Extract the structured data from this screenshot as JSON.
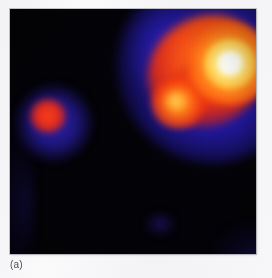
{
  "figure": {
    "panel_label": "(a)",
    "caption_color": "#4b4b52",
    "page_background": "#f5f5f7",
    "frame": {
      "background": "#030206",
      "left": 10,
      "top": 9,
      "width": 246,
      "height": 245
    }
  },
  "palette": {
    "name": "hot-iron",
    "background": "#030206",
    "low": "#1f16a8",
    "mid_low": "#7a1a50",
    "mid": "#ee3a0e",
    "mid_high": "#ffa826",
    "high": "#ffe680",
    "peak": "#ffffff"
  },
  "image_content": {
    "type": "false-color-intensity-map",
    "sources": [
      {
        "name": "primary-source",
        "description": "bright extended source, upper right, with saturated white core",
        "center_x": 220,
        "center_y": 54,
        "peak_color": "#ffffff",
        "halo_color": "#2a1ebe"
      },
      {
        "name": "secondary-knot",
        "description": "orange-yellow knot on the south-west extension of the primary source",
        "center_x": 168,
        "center_y": 94,
        "peak_color": "#ffd668",
        "halo_color": "#f13a0e"
      },
      {
        "name": "companion-source",
        "description": "small compact source, left of field, red core with blue halo",
        "center_x": 38,
        "center_y": 107,
        "peak_color": "#f2300f",
        "halo_color": "#2e22be"
      },
      {
        "name": "faint-feature-lower",
        "description": "very faint blue detection near lower centre",
        "center_x": 150,
        "center_y": 215,
        "peak_color": "#281c96",
        "halo_color": "#0e0a3c"
      },
      {
        "name": "faint-feature-corner",
        "description": "faint blue glow at lower right corner of field",
        "center_x": 248,
        "center_y": 250,
        "peak_color": "#221a8c",
        "halo_color": "#0e0a3c"
      }
    ]
  }
}
